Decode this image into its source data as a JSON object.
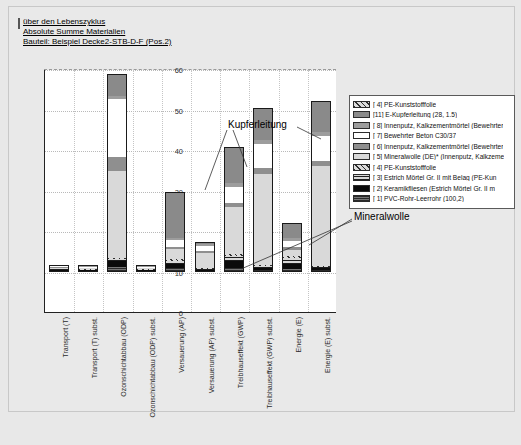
{
  "titles": [
    "über den Lebenszyklus",
    "Absolute Summe Materialien",
    "Bauteil: Beispiel Decke2-STB-D-F (Pos.2)"
  ],
  "annotations": [
    {
      "name": "kupferleitung",
      "text": "Kupferleitung"
    },
    {
      "name": "mineralwolle",
      "text": "Mineralwolle"
    }
  ],
  "legend": {
    "position": "right",
    "items": [
      {
        "label": "[ 4] PE-Kunststofffolie",
        "key": "pe",
        "color": "#d5d5d5"
      },
      {
        "label": "[11] E-Kupferleitung (28, 1.5)",
        "key": "kupfer",
        "color": "#8a8a8a"
      },
      {
        "label": "[ 8] Innenputz, Kalkzementmörtel (Bewehrter",
        "key": "innen8",
        "color": "#9d9d9d"
      },
      {
        "label": "[ 7] Bewehrter Beton C30/37",
        "key": "beton",
        "color": "#ffffff"
      },
      {
        "label": "[ 6] Innenputz, Kalkzementmörtel (Bewehrter",
        "key": "innen6",
        "color": "#8f8f8f"
      },
      {
        "label": "[ 5] Mineralwolle (DE)* (Innenputz, Kalkzeme",
        "key": "mineral",
        "color": "#d9d9d9"
      },
      {
        "label": "[ 4] PE-Kunststofffolie",
        "key": "pe2",
        "color": "#d5d5d5"
      },
      {
        "label": "[ 3] Estrich Mörtel Gr. II mit Belag (PE-Kun",
        "key": "estrich",
        "color": "#cfcfcf"
      },
      {
        "label": "[ 2] Keramikfliesen (Estrich Mörtel Gr. II m",
        "key": "keramik",
        "color": "#0b0b0b"
      },
      {
        "label": "[ 1] PVC-Rohr-Leerrohr (100,2)",
        "key": "pvc",
        "color": "#2a2a2a"
      }
    ]
  },
  "chart_data": {
    "type": "bar",
    "stacked": true,
    "xlabel": "",
    "ylabel": "",
    "ylim": [
      0,
      60
    ],
    "yticks": [
      0,
      10,
      20,
      30,
      40,
      50,
      60
    ],
    "grid": true,
    "categories": [
      "Transport (T)",
      "Transport (T) subst.",
      "Ozonschichtabbau (ODP)",
      "Ozonschichtabbau (ODP) subst.",
      "Versauerung (AP)",
      "Versauerung (AP) subst.",
      "Treibhauseffekt (GWP)",
      "Treibhauseffekt (GWP) subst.",
      "Energie (E)",
      "Energie (E) subst."
    ],
    "totals": [
      1.1,
      0.3,
      48.8,
      0.2,
      19.8,
      7.5,
      30.8,
      40.4,
      12.1,
      42.2
    ],
    "series": [
      {
        "name": "[ 1] PVC-Rohr-Leerrohr (100,2)",
        "key": "pvc",
        "values": [
          0.15,
          0.05,
          1.3,
          0.02,
          0.9,
          0.2,
          1.1,
          0.5,
          0.7,
          0.4
        ]
      },
      {
        "name": "[ 2] Keramikfliesen (Estrich Mörtel Gr. II m",
        "key": "keramik",
        "values": [
          0.2,
          0.05,
          1.4,
          0.02,
          1.1,
          0.3,
          1.6,
          0.5,
          1.3,
          0.5
        ]
      },
      {
        "name": "[ 3] Estrich Mörtel Gr. II mit Belag (PE-Kun",
        "key": "estrich",
        "values": [
          0.25,
          0.06,
          0.5,
          0.02,
          0.8,
          0.3,
          1.3,
          0.4,
          1.5,
          0.4
        ]
      },
      {
        "name": "[ 4] PE-Kunststofffolie",
        "key": "pe",
        "values": [
          0.1,
          0.03,
          0.3,
          0.01,
          0.4,
          0.2,
          0.5,
          0.3,
          0.4,
          0.3
        ]
      },
      {
        "name": "[ 5] Mineralwolle (DE)* (Innenputz, Kalkzeme",
        "key": "mineral",
        "values": [
          0.15,
          0.04,
          21.5,
          0.04,
          2.4,
          3.6,
          11.6,
          22.5,
          1.6,
          24.5
        ]
      },
      {
        "name": "[ 6] Innenputz, Kalkzementmörtel (Bewehrter",
        "key": "innen6",
        "values": [
          0.05,
          0.02,
          3.3,
          0.02,
          0.7,
          0.5,
          0.9,
          1.4,
          0.6,
          1.2
        ]
      },
      {
        "name": "[ 7] Bewehrter Beton C30/37",
        "key": "beton",
        "values": [
          0.1,
          0.03,
          14.5,
          0.03,
          1.6,
          1.4,
          3.9,
          6.1,
          1.6,
          6.4
        ]
      },
      {
        "name": "[ 8] Innenputz, Kalkzementmörtel (Bewehrter",
        "key": "innen8",
        "values": [
          0.05,
          0.01,
          0.8,
          0.01,
          0.4,
          0.3,
          1.0,
          0.9,
          0.6,
          0.9
        ]
      },
      {
        "name": "[11] E-Kupferleitung (28, 1.5)",
        "key": "kupfer",
        "values": [
          0.05,
          0.01,
          5.2,
          0.03,
          11.5,
          0.7,
          8.9,
          7.8,
          3.8,
          7.6
        ]
      }
    ]
  }
}
